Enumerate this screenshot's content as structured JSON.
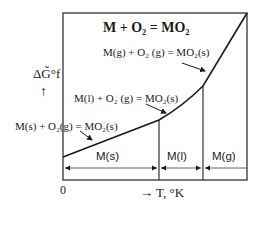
{
  "diagram": {
    "title": "M + O₂ = MO₂",
    "reactions": [
      {
        "id": "solid",
        "label": "M(s) + O₂(g) = MO₂(s)"
      },
      {
        "id": "liquid",
        "label": "M(l) + O₂ (g) = MO₂(s)"
      },
      {
        "id": "gas",
        "label": "M(g) + O₂ (g) = MO₂(s)"
      }
    ],
    "phases": [
      {
        "id": "solid",
        "label": "M(s)"
      },
      {
        "id": "liquid",
        "label": "M(l)"
      },
      {
        "id": "gas",
        "label": "M(g)"
      }
    ],
    "y_axis": {
      "label": "ΔG̃°f",
      "arrow": "↑"
    },
    "x_axis": {
      "origin": "0",
      "label": "→ T, °K"
    },
    "colors": {
      "line": "#1a1a1a",
      "background": "#ffffff"
    }
  }
}
